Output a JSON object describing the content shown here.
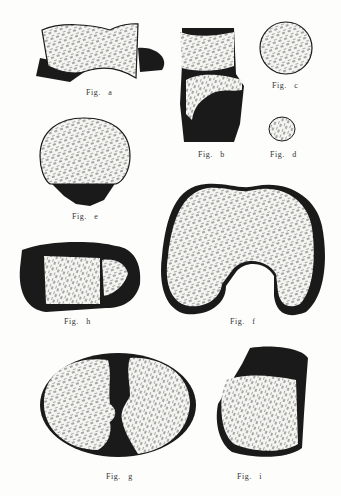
{
  "plate": {
    "figures": [
      {
        "id": "a",
        "label": "Fig.   a"
      },
      {
        "id": "b",
        "label": "Fig.   b"
      },
      {
        "id": "c",
        "label": "Fig.   c"
      },
      {
        "id": "d",
        "label": "Fig.   d"
      },
      {
        "id": "e",
        "label": "Fig.   e"
      },
      {
        "id": "f",
        "label": "Fig.   f"
      },
      {
        "id": "g",
        "label": "Fig.   g"
      },
      {
        "id": "h",
        "label": "Fig.   h"
      },
      {
        "id": "i",
        "label": "Fig.   i"
      }
    ]
  },
  "colors": {
    "paper": "#fdfdfb",
    "ink": "#1a1a1a",
    "cartilage": "#f4f4f0"
  }
}
